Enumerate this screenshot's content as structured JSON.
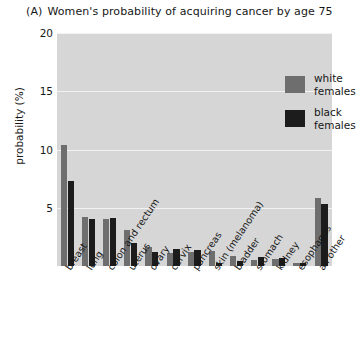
{
  "figure": {
    "panel_letter": "(A)",
    "title": "Women's probability of acquiring cancer by age 75"
  },
  "legend": {
    "position": "top-right-inside",
    "entries": [
      {
        "label": "white\nfemales",
        "color": "#6e6e6e",
        "key": "white_females"
      },
      {
        "label": "black\nfemales",
        "color": "#1c1c1c",
        "key": "black_females"
      }
    ]
  },
  "axes": {
    "ylabel": "probability (%)",
    "yticks": [
      "5",
      "10",
      "15",
      "20"
    ],
    "ytick_values": [
      5,
      10,
      15,
      20
    ],
    "ylim": [
      0,
      20
    ],
    "xlabel": ""
  },
  "chart_data": {
    "type": "bar",
    "title": "Women's probability of acquiring cancer by age 75",
    "xlabel": "",
    "ylabel": "probability (%)",
    "ylim": [
      0,
      20
    ],
    "yticks": [
      5,
      10,
      15,
      20
    ],
    "grid": true,
    "legend_position": "upper right inside plot",
    "categories": [
      "breast",
      "lung",
      "colon and rectum",
      "uterus",
      "ovary",
      "cervix",
      "pancreas",
      "skin (melanoma)",
      "bladder",
      "stomach",
      "kidney",
      "esophagus",
      "all other"
    ],
    "series": [
      {
        "name": "white females",
        "color": "#6e6e6e",
        "values": [
          10.4,
          4.2,
          4.0,
          3.1,
          1.6,
          1.1,
          1.2,
          1.3,
          0.9,
          0.5,
          0.6,
          0.3,
          5.8
        ]
      },
      {
        "name": "black females",
        "color": "#1c1c1c",
        "values": [
          7.3,
          4.0,
          4.1,
          2.0,
          1.2,
          1.5,
          1.4,
          0.3,
          0.4,
          0.8,
          0.7,
          0.3,
          5.3
        ]
      }
    ]
  },
  "colors": {
    "plot_background": "#d6d6d6",
    "gridline": "#f2f2f2",
    "page_background": "#ffffff",
    "text": "#171717"
  }
}
